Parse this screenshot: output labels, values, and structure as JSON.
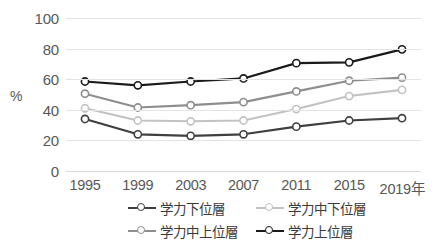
{
  "chart_data": {
    "type": "line",
    "title": "",
    "xlabel": "",
    "ylabel": "%",
    "ylim": [
      0,
      100
    ],
    "ytick_values": [
      100,
      80,
      60,
      40,
      20,
      0
    ],
    "ytick_labels": [
      "100",
      "80",
      "60",
      "40",
      "20",
      "0"
    ],
    "categories": [
      "1995",
      "1999",
      "2003",
      "2007",
      "2011",
      "2015",
      "2019年"
    ],
    "x": [
      1995,
      1999,
      2003,
      2007,
      2011,
      2015,
      2019
    ],
    "grid": true,
    "legend_position": "bottom",
    "series": [
      {
        "name": "学力下位層",
        "color": "#3f3f3f",
        "values": [
          34,
          24,
          23,
          24,
          29,
          33,
          34.5
        ]
      },
      {
        "name": "学力中下位層",
        "color": "#c2c2c2",
        "values": [
          41,
          33,
          32.5,
          33,
          40.5,
          49,
          53
        ]
      },
      {
        "name": "学力中上位層",
        "color": "#8e8e8e",
        "values": [
          50.5,
          41.5,
          43,
          45,
          52,
          59,
          61
        ]
      },
      {
        "name": "学力上位層",
        "color": "#1a1a1a",
        "values": [
          58.5,
          56,
          58.5,
          60.5,
          70.5,
          71,
          79.5
        ]
      }
    ]
  },
  "legend": {
    "items": [
      {
        "label": "学力下位層",
        "color": "#3f3f3f"
      },
      {
        "label": "学力中下位層",
        "color": "#c2c2c2"
      },
      {
        "label": "学力中上位層",
        "color": "#8e8e8e"
      },
      {
        "label": "学力上位層",
        "color": "#1a1a1a"
      }
    ]
  },
  "axis": {
    "y_title": "%"
  },
  "colors": {
    "gridline": "#e3e3e1",
    "text": "#585858",
    "background": "#ffffff"
  }
}
